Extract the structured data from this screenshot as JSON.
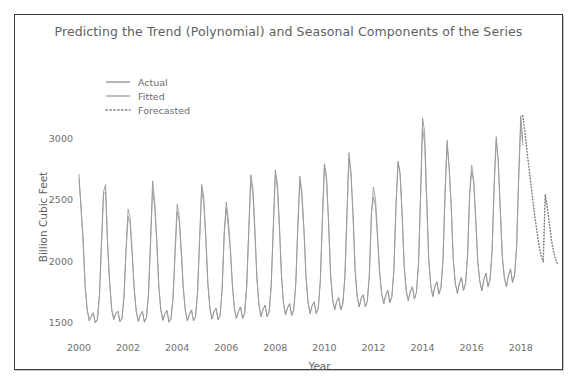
{
  "chart_data": {
    "type": "line",
    "title": "Predicting the Trend (Polynomial) and Seasonal Components of the Series",
    "xlabel": "Year",
    "ylabel": "Billion Cubic Feet",
    "xlim": [
      2000.0,
      2019.6
    ],
    "ylim": [
      1380,
      3300
    ],
    "xticks": [
      2000,
      2002,
      2004,
      2006,
      2008,
      2010,
      2012,
      2014,
      2016,
      2018
    ],
    "xticklabels": [
      "2000",
      "2002",
      "2004",
      "2006",
      "2008",
      "2010",
      "2012",
      "2014",
      "2016",
      "2018"
    ],
    "yticks": [
      1500,
      2000,
      2500,
      3000
    ],
    "yticklabels": [
      "1500",
      "2000",
      "2500",
      "3000"
    ],
    "grid": false,
    "legend_position": "upper left",
    "colors": {
      "actual": "#8f8f8f",
      "fitted": "#9a9a9a",
      "forecasted": "#7d7d7d",
      "title_text": "#5f5f5f",
      "tick_text": "#6e6e6e",
      "frame": "#3a3a3a",
      "background": "#ffffff"
    },
    "series": [
      {
        "name": "Actual",
        "style": "solid",
        "x": [
          2000.0,
          2000.083,
          2000.167,
          2000.25,
          2000.333,
          2000.417,
          2000.5,
          2000.583,
          2000.667,
          2000.75,
          2000.833,
          2000.917,
          2001.0,
          2001.083,
          2001.167,
          2001.25,
          2001.333,
          2001.417,
          2001.5,
          2001.583,
          2001.667,
          2001.75,
          2001.833,
          2001.917,
          2002.0,
          2002.083,
          2002.167,
          2002.25,
          2002.333,
          2002.417,
          2002.5,
          2002.583,
          2002.667,
          2002.75,
          2002.833,
          2002.917,
          2003.0,
          2003.083,
          2003.167,
          2003.25,
          2003.333,
          2003.417,
          2003.5,
          2003.583,
          2003.667,
          2003.75,
          2003.833,
          2003.917,
          2004.0,
          2004.083,
          2004.167,
          2004.25,
          2004.333,
          2004.417,
          2004.5,
          2004.583,
          2004.667,
          2004.75,
          2004.833,
          2004.917,
          2005.0,
          2005.083,
          2005.167,
          2005.25,
          2005.333,
          2005.417,
          2005.5,
          2005.583,
          2005.667,
          2005.75,
          2005.833,
          2005.917,
          2006.0,
          2006.083,
          2006.167,
          2006.25,
          2006.333,
          2006.417,
          2006.5,
          2006.583,
          2006.667,
          2006.75,
          2006.833,
          2006.917,
          2007.0,
          2007.083,
          2007.167,
          2007.25,
          2007.333,
          2007.417,
          2007.5,
          2007.583,
          2007.667,
          2007.75,
          2007.833,
          2007.917,
          2008.0,
          2008.083,
          2008.167,
          2008.25,
          2008.333,
          2008.417,
          2008.5,
          2008.583,
          2008.667,
          2008.75,
          2008.833,
          2008.917,
          2009.0,
          2009.083,
          2009.167,
          2009.25,
          2009.333,
          2009.417,
          2009.5,
          2009.583,
          2009.667,
          2009.75,
          2009.833,
          2009.917,
          2010.0,
          2010.083,
          2010.167,
          2010.25,
          2010.333,
          2010.417,
          2010.5,
          2010.583,
          2010.667,
          2010.75,
          2010.833,
          2010.917,
          2011.0,
          2011.083,
          2011.167,
          2011.25,
          2011.333,
          2011.417,
          2011.5,
          2011.583,
          2011.667,
          2011.75,
          2011.833,
          2011.917,
          2012.0,
          2012.083,
          2012.167,
          2012.25,
          2012.333,
          2012.417,
          2012.5,
          2012.583,
          2012.667,
          2012.75,
          2012.833,
          2012.917,
          2013.0,
          2013.083,
          2013.167,
          2013.25,
          2013.333,
          2013.417,
          2013.5,
          2013.583,
          2013.667,
          2013.75,
          2013.833,
          2013.917,
          2014.0,
          2014.083,
          2014.167,
          2014.25,
          2014.333,
          2014.417,
          2014.5,
          2014.583,
          2014.667,
          2014.75,
          2014.833,
          2014.917,
          2015.0,
          2015.083,
          2015.167,
          2015.25,
          2015.333,
          2015.417,
          2015.5,
          2015.583,
          2015.667,
          2015.75,
          2015.833,
          2015.917,
          2016.0,
          2016.083,
          2016.167,
          2016.25,
          2016.333,
          2016.417,
          2016.5,
          2016.583,
          2016.667,
          2016.75,
          2016.833,
          2016.917,
          2017.0,
          2017.083,
          2017.167,
          2017.25,
          2017.333,
          2017.417,
          2017.5,
          2017.583,
          2017.667,
          2017.75,
          2017.833,
          2017.917,
          2018.0,
          2018.083
        ],
        "y": [
          2700,
          2420,
          2180,
          1790,
          1600,
          1510,
          1545,
          1570,
          1495,
          1520,
          1720,
          2150,
          2560,
          2620,
          2120,
          1820,
          1600,
          1520,
          1575,
          1590,
          1505,
          1530,
          1700,
          2080,
          2360,
          2300,
          2050,
          1760,
          1585,
          1505,
          1560,
          1590,
          1500,
          1540,
          1740,
          2170,
          2650,
          2480,
          2180,
          1800,
          1600,
          1515,
          1570,
          1595,
          1500,
          1525,
          1690,
          2060,
          2400,
          2330,
          2060,
          1770,
          1595,
          1510,
          1565,
          1600,
          1510,
          1545,
          1755,
          2190,
          2620,
          2520,
          2200,
          1820,
          1615,
          1525,
          1585,
          1615,
          1520,
          1555,
          1770,
          2230,
          2430,
          2280,
          2090,
          1800,
          1610,
          1530,
          1590,
          1625,
          1530,
          1570,
          1790,
          2250,
          2700,
          2600,
          2260,
          1860,
          1640,
          1545,
          1605,
          1640,
          1545,
          1585,
          1800,
          2270,
          2740,
          2630,
          2290,
          1880,
          1655,
          1560,
          1620,
          1650,
          1555,
          1600,
          1810,
          2280,
          2660,
          2520,
          2240,
          1870,
          1660,
          1570,
          1635,
          1665,
          1570,
          1615,
          1830,
          2330,
          2790,
          2700,
          2330,
          1900,
          1690,
          1600,
          1670,
          1700,
          1600,
          1650,
          1860,
          2360,
          2880,
          2720,
          2380,
          1930,
          1715,
          1625,
          1695,
          1725,
          1625,
          1675,
          1890,
          2390,
          2520,
          2440,
          2180,
          1900,
          1730,
          1650,
          1720,
          1760,
          1660,
          1710,
          1930,
          2450,
          2810,
          2720,
          2390,
          1960,
          1760,
          1675,
          1750,
          1790,
          1690,
          1745,
          1970,
          2510,
          3160,
          3050,
          2520,
          2020,
          1800,
          1710,
          1790,
          1830,
          1730,
          1785,
          2010,
          2560,
          2980,
          2760,
          2450,
          2010,
          1820,
          1735,
          1820,
          1865,
          1760,
          1815,
          2040,
          2530,
          2730,
          2640,
          2330,
          1990,
          1830,
          1755,
          1850,
          1900,
          1790,
          1850,
          2080,
          2620,
          3010,
          2820,
          2420,
          2030,
          1865,
          1790,
          1885,
          1935,
          1825,
          1885,
          2120,
          2680,
          3180,
          2980
        ]
      },
      {
        "name": "Fitted",
        "style": "solid",
        "x": [
          2000.0,
          2000.083,
          2000.167,
          2000.25,
          2000.333,
          2000.417,
          2000.5,
          2000.583,
          2000.667,
          2000.75,
          2000.833,
          2000.917,
          2001.0,
          2001.083,
          2001.167,
          2001.25,
          2001.333,
          2001.417,
          2001.5,
          2001.583,
          2001.667,
          2001.75,
          2001.833,
          2001.917,
          2002.0,
          2002.083,
          2002.167,
          2002.25,
          2002.333,
          2002.417,
          2002.5,
          2002.583,
          2002.667,
          2002.75,
          2002.833,
          2002.917,
          2003.0,
          2003.083,
          2003.167,
          2003.25,
          2003.333,
          2003.417,
          2003.5,
          2003.583,
          2003.667,
          2003.75,
          2003.833,
          2003.917,
          2004.0,
          2004.083,
          2004.167,
          2004.25,
          2004.333,
          2004.417,
          2004.5,
          2004.583,
          2004.667,
          2004.75,
          2004.833,
          2004.917,
          2005.0,
          2005.083,
          2005.167,
          2005.25,
          2005.333,
          2005.417,
          2005.5,
          2005.583,
          2005.667,
          2005.75,
          2005.833,
          2005.917,
          2006.0,
          2006.083,
          2006.167,
          2006.25,
          2006.333,
          2006.417,
          2006.5,
          2006.583,
          2006.667,
          2006.75,
          2006.833,
          2006.917,
          2007.0,
          2007.083,
          2007.167,
          2007.25,
          2007.333,
          2007.417,
          2007.5,
          2007.583,
          2007.667,
          2007.75,
          2007.833,
          2007.917,
          2008.0,
          2008.083,
          2008.167,
          2008.25,
          2008.333,
          2008.417,
          2008.5,
          2008.583,
          2008.667,
          2008.75,
          2008.833,
          2008.917,
          2009.0,
          2009.083,
          2009.167,
          2009.25,
          2009.333,
          2009.417,
          2009.5,
          2009.583,
          2009.667,
          2009.75,
          2009.833,
          2009.917,
          2010.0,
          2010.083,
          2010.167,
          2010.25,
          2010.333,
          2010.417,
          2010.5,
          2010.583,
          2010.667,
          2010.75,
          2010.833,
          2010.917,
          2011.0,
          2011.083,
          2011.167,
          2011.25,
          2011.333,
          2011.417,
          2011.5,
          2011.583,
          2011.667,
          2011.75,
          2011.833,
          2011.917,
          2012.0,
          2012.083,
          2012.167,
          2012.25,
          2012.333,
          2012.417,
          2012.5,
          2012.583,
          2012.667,
          2012.75,
          2012.833,
          2012.917,
          2013.0,
          2013.083,
          2013.167,
          2013.25,
          2013.333,
          2013.417,
          2013.5,
          2013.583,
          2013.667,
          2013.75,
          2013.833,
          2013.917,
          2014.0,
          2014.083,
          2014.167,
          2014.25,
          2014.333,
          2014.417,
          2014.5,
          2014.583,
          2014.667,
          2014.75,
          2014.833,
          2014.917,
          2015.0,
          2015.083,
          2015.167,
          2015.25,
          2015.333,
          2015.417,
          2015.5,
          2015.583,
          2015.667,
          2015.75,
          2015.833,
          2015.917,
          2016.0,
          2016.083,
          2016.167,
          2016.25,
          2016.333,
          2016.417,
          2016.5,
          2016.583,
          2016.667,
          2016.75,
          2016.833,
          2016.917,
          2017.0,
          2017.083,
          2017.167,
          2017.25,
          2017.333,
          2017.417,
          2017.5,
          2017.583,
          2017.667,
          2017.75,
          2017.833,
          2017.917,
          2018.0,
          2018.083
        ],
        "y": [
          2660,
          2450,
          2150,
          1800,
          1610,
          1520,
          1552,
          1578,
          1500,
          1528,
          1715,
          2130,
          2545,
          2560,
          2140,
          1815,
          1608,
          1522,
          1570,
          1592,
          1505,
          1532,
          1708,
          2105,
          2420,
          2350,
          2080,
          1775,
          1592,
          1512,
          1562,
          1588,
          1502,
          1538,
          1730,
          2150,
          2570,
          2450,
          2160,
          1805,
          1604,
          1518,
          1568,
          1596,
          1506,
          1535,
          1710,
          2110,
          2460,
          2370,
          2090,
          1785,
          1598,
          1515,
          1568,
          1600,
          1512,
          1548,
          1752,
          2175,
          2580,
          2470,
          2180,
          1818,
          1614,
          1528,
          1584,
          1614,
          1522,
          1558,
          1768,
          2205,
          2480,
          2340,
          2110,
          1808,
          1612,
          1534,
          1592,
          1624,
          1532,
          1572,
          1788,
          2240,
          2650,
          2550,
          2230,
          1855,
          1638,
          1548,
          1604,
          1638,
          1546,
          1586,
          1800,
          2265,
          2700,
          2590,
          2270,
          1875,
          1652,
          1562,
          1618,
          1652,
          1556,
          1600,
          1812,
          2285,
          2690,
          2560,
          2255,
          1872,
          1662,
          1572,
          1636,
          1666,
          1572,
          1616,
          1832,
          2330,
          2760,
          2670,
          2320,
          1898,
          1688,
          1602,
          1668,
          1700,
          1602,
          1650,
          1858,
          2358,
          2830,
          2700,
          2360,
          1925,
          1712,
          1624,
          1694,
          1724,
          1624,
          1674,
          1888,
          2388,
          2600,
          2500,
          2210,
          1910,
          1732,
          1652,
          1722,
          1758,
          1658,
          1708,
          1928,
          2448,
          2800,
          2700,
          2370,
          1955,
          1758,
          1676,
          1748,
          1788,
          1688,
          1744,
          1968,
          2508,
          3080,
          2960,
          2480,
          2012,
          1798,
          1708,
          1788,
          1828,
          1728,
          1784,
          2008,
          2556,
          2940,
          2760,
          2440,
          2008,
          1818,
          1734,
          1818,
          1862,
          1758,
          1814,
          2038,
          2540,
          2780,
          2660,
          2340,
          1992,
          1830,
          1754,
          1848,
          1898,
          1788,
          1848,
          2078,
          2612,
          2970,
          2800,
          2410,
          2028,
          1862,
          1788,
          1882,
          1932,
          1822,
          1882,
          2118,
          2672,
          3120,
          2940
        ]
      },
      {
        "name": "Forecasted",
        "style": "dotted",
        "x": [
          2018.083,
          2018.167,
          2018.25,
          2018.333,
          2018.417,
          2018.5,
          2018.583,
          2018.667,
          2018.75,
          2018.833,
          2018.917,
          2019.0,
          2019.083,
          2019.167,
          2019.25,
          2019.333,
          2019.417,
          2019.5
        ],
        "y": [
          3180,
          3050,
          2900,
          2760,
          2620,
          2480,
          2350,
          2230,
          2120,
          2040,
          1990,
          2540,
          2430,
          2300,
          2170,
          2080,
          2010,
          1975
        ]
      }
    ]
  },
  "legend": {
    "items": [
      {
        "label": "Actual",
        "style": "solid"
      },
      {
        "label": "Fitted",
        "style": "solid"
      },
      {
        "label": "Forecasted",
        "style": "dotted"
      }
    ]
  }
}
